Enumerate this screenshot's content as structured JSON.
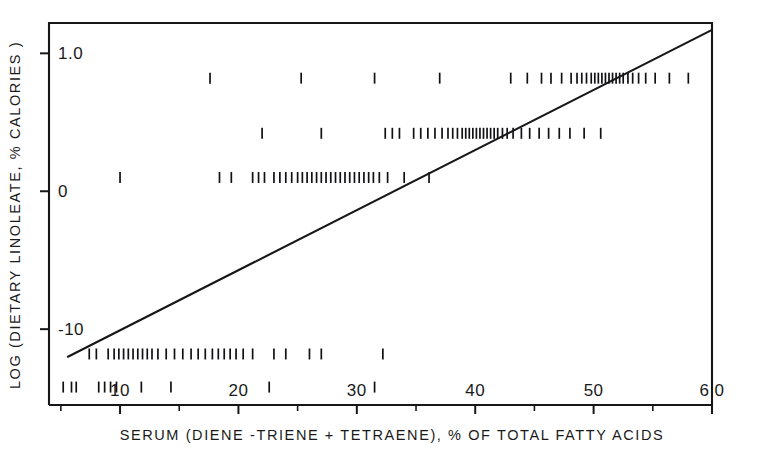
{
  "figure": {
    "kind": "scatter-plot",
    "background_color": "#ffffff",
    "ink_color": "#17171a",
    "note": "Scanned journal figure: dietary linoleate vs serum polyunsaturated fatty acid index"
  },
  "chart_data": {
    "type": "scatter",
    "title": "",
    "subtitle": "",
    "xlabel": "SERUM (DIENE -TRIENE + TETRAENE), % OF TOTAL FATTY ACIDS",
    "ylabel": "LOG (DIETARY LINOLEATE, % CALORIES )",
    "xlim": [
      4.0,
      60.0
    ],
    "ylim": [
      -1.55,
      1.22
    ],
    "grid": false,
    "legend": null,
    "x_major_ticks": [
      10,
      20,
      30,
      40,
      50,
      60
    ],
    "x_major_tick_labels": [
      "10",
      "20",
      "30",
      "40",
      "50",
      "6 0"
    ],
    "x_minor_ticks": [
      5,
      15,
      25,
      35,
      45,
      55
    ],
    "y_major_ticks": [
      1.0,
      0.0,
      -1.0
    ],
    "y_major_tick_labels": [
      "1.0",
      "0",
      "-10"
    ],
    "marker_style": "short vertical tick",
    "bands": [
      {
        "name": "band-top",
        "y_value": 0.82,
        "x_values": [
          17.6,
          25.3,
          31.5,
          37.0,
          43.0,
          44.4,
          45.6,
          46.4,
          47.3,
          48.1,
          48.6,
          49.0,
          49.4,
          49.8,
          50.1,
          50.4,
          50.7,
          51.0,
          51.3,
          51.6,
          51.9,
          52.2,
          52.5,
          52.9,
          53.3,
          53.8,
          54.4,
          55.2,
          56.4,
          58.0
        ]
      },
      {
        "name": "band-upper-mid",
        "y_value": 0.42,
        "x_values": [
          22.0,
          27.0,
          32.4,
          33.0,
          33.6,
          34.8,
          35.4,
          36.0,
          36.6,
          37.2,
          37.7,
          38.1,
          38.5,
          38.9,
          39.2,
          39.5,
          39.8,
          40.1,
          40.4,
          40.7,
          41.0,
          41.3,
          41.6,
          41.9,
          42.3,
          42.7,
          43.2,
          43.9,
          44.6,
          45.4,
          46.2,
          47.1,
          48.0,
          49.2,
          50.6
        ]
      },
      {
        "name": "band-zero",
        "y_value": 0.1,
        "x_values": [
          10.0,
          18.4,
          19.4,
          21.2,
          21.7,
          22.2,
          23.0,
          23.5,
          24.0,
          24.5,
          25.0,
          25.4,
          25.8,
          26.2,
          26.6,
          27.0,
          27.4,
          27.8,
          28.2,
          28.6,
          29.0,
          29.4,
          29.8,
          30.2,
          30.6,
          31.0,
          31.4,
          31.9,
          32.6,
          34.0,
          36.1
        ]
      },
      {
        "name": "band-lower",
        "y_value": -1.18,
        "x_values": [
          7.4,
          8.0,
          9.0,
          9.5,
          9.9,
          10.3,
          10.7,
          11.1,
          11.5,
          11.9,
          12.3,
          12.7,
          13.2,
          13.9,
          14.6,
          15.3,
          16.0,
          16.6,
          17.2,
          17.8,
          18.3,
          18.8,
          19.3,
          19.8,
          20.4,
          21.2,
          23.0,
          24.0,
          26.0,
          27.0,
          32.2
        ]
      },
      {
        "name": "band-bottom",
        "y_value": -1.42,
        "x_values": [
          5.2,
          5.9,
          6.3,
          8.2,
          8.7,
          9.2,
          9.7,
          11.8,
          14.3,
          22.6,
          31.5
        ]
      }
    ],
    "regression_line": {
      "label": "",
      "x_start": 5.6,
      "y_start": -1.2,
      "x_end": 60.0,
      "y_end": 1.17
    }
  }
}
